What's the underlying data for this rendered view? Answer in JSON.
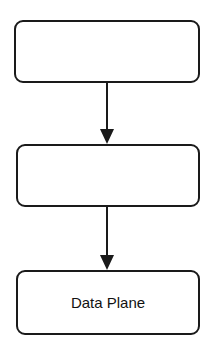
{
  "diagram": {
    "type": "flowchart",
    "nodes": [
      {
        "id": "node1",
        "label": ""
      },
      {
        "id": "node2",
        "label": ""
      },
      {
        "id": "node3",
        "label": "Data Plane"
      }
    ],
    "edges": [
      {
        "from": "node1",
        "to": "node2"
      },
      {
        "from": "node2",
        "to": "node3"
      }
    ],
    "colors": {
      "stroke": "#1a1a1a",
      "fill": "#ffffff",
      "text": "#111111"
    }
  }
}
